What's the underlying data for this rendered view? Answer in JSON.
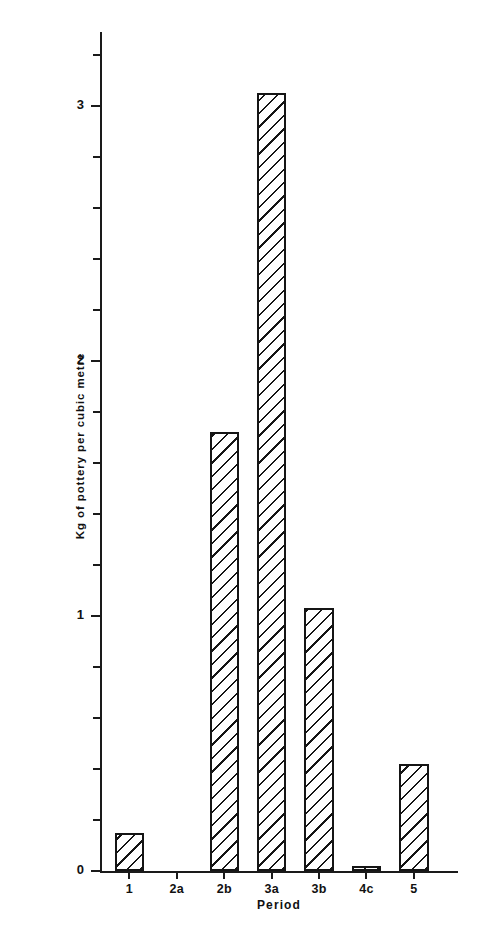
{
  "chart_data": {
    "type": "bar",
    "title": "",
    "xlabel": "Period",
    "ylabel": "Kg of pottery per cubic metre",
    "categories": [
      "1",
      "2a",
      "2b",
      "3a",
      "3b",
      "4c",
      "5"
    ],
    "values": [
      0.15,
      0.0,
      1.72,
      3.05,
      1.03,
      0.02,
      0.42
    ],
    "ylim": [
      0,
      3.3
    ],
    "xlim": [
      0,
      7
    ],
    "ytick_labels": [
      "0",
      "1",
      "2",
      "3"
    ],
    "ytick_values": [
      0,
      1,
      2,
      3
    ],
    "yminor_tick_step": 0.2,
    "grid": false,
    "legend": null,
    "bar_fill": "diagonal-hatch",
    "bar_edge_color": "#151515",
    "axis_color": "#1a1a1a",
    "background": "#ffffff"
  },
  "axes": {
    "y_title": "Kg of pottery per cubic metre",
    "x_title": "Period",
    "y_labels": [
      {
        "text": "0",
        "value": 0
      },
      {
        "text": "1",
        "value": 1
      },
      {
        "text": "2",
        "value": 2
      },
      {
        "text": "3",
        "value": 3
      }
    ],
    "x_labels": [
      {
        "text": "1"
      },
      {
        "text": "2a"
      },
      {
        "text": "2b"
      },
      {
        "text": "3a"
      },
      {
        "text": "3b"
      },
      {
        "text": "4c"
      },
      {
        "text": "5"
      }
    ]
  }
}
